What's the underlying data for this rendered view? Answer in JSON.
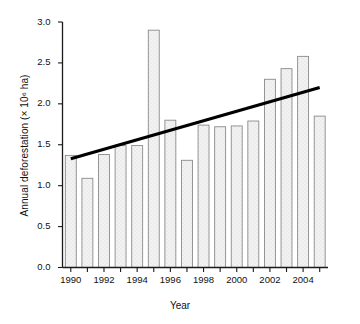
{
  "chart_data": {
    "type": "bar",
    "title": "",
    "xlabel": "Year",
    "ylabel": "Annual deforestation (× 10⁶ ha)",
    "categories": [
      1990,
      1991,
      1992,
      1993,
      1994,
      1995,
      1996,
      1997,
      1998,
      1999,
      2000,
      2001,
      2002,
      2003,
      2004,
      2005
    ],
    "values": [
      1.37,
      1.09,
      1.38,
      1.49,
      1.49,
      2.9,
      1.8,
      1.31,
      1.74,
      1.72,
      1.73,
      1.79,
      2.3,
      2.43,
      2.58,
      1.85
    ],
    "ylim": [
      0.0,
      3.0
    ],
    "ytick_labels": [
      "0.0",
      "0.5",
      "1.0",
      "1.5",
      "2.0",
      "2.5",
      "3.0"
    ],
    "ytick_values": [
      0.0,
      0.5,
      1.0,
      1.5,
      2.0,
      2.5,
      3.0
    ],
    "xtick_labels": [
      "1990",
      "1992",
      "1994",
      "1996",
      "1998",
      "2000",
      "2002",
      "2004"
    ],
    "xtick_values": [
      1990,
      1992,
      1994,
      1996,
      1998,
      2000,
      2002,
      2004
    ],
    "grid": false,
    "legend": null,
    "series": [
      {
        "name": "Annual deforestation",
        "type": "bar",
        "values": [
          1.37,
          1.09,
          1.38,
          1.49,
          1.49,
          2.9,
          1.8,
          1.31,
          1.74,
          1.72,
          1.73,
          1.79,
          2.3,
          2.43,
          2.58,
          1.85
        ]
      },
      {
        "name": "Linear trend",
        "type": "line",
        "x": [
          1990,
          2005
        ],
        "values": [
          1.33,
          2.2
        ]
      }
    ],
    "colors": {
      "bar_fill": "#efefef",
      "bar_edge": "#8a8a8a",
      "trend_line": "#000000",
      "axis": "#1a1a1a",
      "text": "#111111"
    }
  }
}
